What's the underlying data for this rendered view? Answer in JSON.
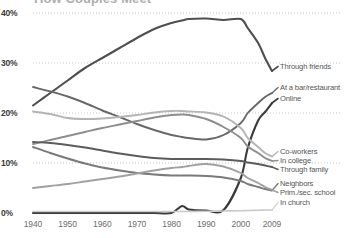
{
  "chart_data": {
    "type": "line",
    "title": "How Couples Meet",
    "xlabel": "",
    "ylabel": "",
    "xlim": [
      1940,
      2009
    ],
    "ylim": [
      0,
      40
    ],
    "grid": true,
    "legend_position": "right-inline-labels",
    "x_ticks": [
      "1940",
      "1950",
      "1960",
      "1970",
      "1980",
      "1990",
      "2000",
      "2009"
    ],
    "x_tick_values": [
      1940,
      1950,
      1960,
      1970,
      1980,
      1990,
      2000,
      2009
    ],
    "y_ticks": [
      "0%",
      "10%",
      "20%",
      "30%",
      "40%"
    ],
    "y_tick_values": [
      0,
      10,
      20,
      30,
      40
    ],
    "x": [
      1940,
      1945,
      1950,
      1955,
      1960,
      1965,
      1970,
      1975,
      1980,
      1983,
      1985,
      1990,
      1995,
      2000,
      2002,
      2005,
      2007,
      2009
    ],
    "series": [
      {
        "name": "Through friends",
        "color": "#4f4f4f",
        "width": 2.1,
        "values": [
          21.5,
          24.0,
          26.5,
          29.0,
          31.0,
          33.0,
          35.0,
          36.8,
          38.0,
          38.5,
          38.8,
          38.9,
          38.6,
          38.8,
          37.0,
          34.0,
          31.0,
          28.4
        ]
      },
      {
        "name": "At a bar/restaurant",
        "color": "#686868",
        "width": 1.9,
        "values": [
          25.2,
          24.3,
          23.3,
          22.0,
          20.5,
          19.2,
          17.8,
          16.6,
          15.6,
          15.2,
          15.0,
          14.7,
          15.6,
          18.0,
          20.0,
          22.0,
          23.2,
          24.0
        ]
      },
      {
        "name": "Online",
        "color": "#3a3a3a",
        "width": 2.1,
        "values": [
          0.0,
          0.0,
          0.0,
          0.0,
          0.0,
          0.0,
          0.0,
          0.0,
          0.0,
          1.4,
          0.7,
          0.5,
          0.6,
          7.0,
          13.0,
          18.5,
          20.2,
          22.0
        ]
      },
      {
        "name": "Co-workers",
        "color": "#b4b4b4",
        "width": 1.9,
        "values": [
          20.3,
          19.8,
          19.0,
          18.8,
          18.9,
          19.2,
          19.6,
          20.1,
          20.4,
          20.4,
          20.3,
          20.1,
          19.3,
          17.0,
          15.0,
          13.2,
          12.0,
          11.3
        ]
      },
      {
        "name": "In college",
        "color": "#8e8e8e",
        "width": 1.9,
        "values": [
          13.8,
          14.6,
          15.4,
          16.2,
          17.0,
          17.7,
          18.4,
          19.1,
          19.6,
          19.7,
          19.6,
          18.8,
          17.2,
          15.0,
          13.3,
          12.0,
          11.0,
          10.4
        ]
      },
      {
        "name": "Through family",
        "color": "#5c5c5c",
        "width": 1.9,
        "values": [
          14.2,
          14.0,
          13.6,
          13.1,
          12.5,
          11.9,
          11.4,
          11.0,
          10.8,
          10.8,
          10.8,
          10.8,
          10.7,
          10.4,
          10.1,
          9.8,
          9.5,
          9.2
        ]
      },
      {
        "name": "Neighbors",
        "color": "#7a7a7a",
        "width": 1.9,
        "values": [
          13.2,
          12.0,
          10.9,
          9.9,
          9.1,
          8.5,
          8.0,
          7.7,
          7.5,
          7.5,
          7.5,
          7.4,
          7.1,
          6.4,
          5.8,
          5.2,
          4.8,
          4.5
        ]
      },
      {
        "name": "Prim./sec. school",
        "color": "#a0a0a0",
        "width": 1.9,
        "values": [
          5.0,
          5.4,
          5.8,
          6.3,
          6.8,
          7.3,
          7.9,
          8.5,
          9.0,
          9.2,
          9.4,
          9.8,
          9.3,
          8.0,
          7.0,
          6.0,
          5.2,
          4.6
        ]
      },
      {
        "name": "In church",
        "color": "#c9c9c9",
        "width": 1.7,
        "values": [
          0.3,
          0.3,
          0.3,
          0.3,
          0.3,
          0.3,
          0.3,
          0.3,
          0.3,
          0.3,
          0.3,
          0.35,
          0.4,
          0.45,
          0.5,
          0.55,
          0.6,
          0.6
        ]
      }
    ],
    "series_labels": [
      {
        "name": "Through friends",
        "y_px": 69
      },
      {
        "name": "At a bar/restaurant",
        "y_px": 90
      },
      {
        "name": "Online",
        "y_px": 101
      },
      {
        "name": "Co-workers",
        "y_px": 154
      },
      {
        "name": "In college",
        "y_px": 163
      },
      {
        "name": "Through family",
        "y_px": 172
      },
      {
        "name": "Neighbors",
        "y_px": 186
      },
      {
        "name": "Prim./sec. school",
        "y_px": 195
      },
      {
        "name": "In church",
        "y_px": 205
      }
    ],
    "colors": {
      "gridline": "#b9b9b9",
      "axis_text": "#6e6e6e",
      "ylabel_text": "#3a3a3a",
      "series_label_text": "#555555",
      "background": "#ffffff"
    }
  }
}
